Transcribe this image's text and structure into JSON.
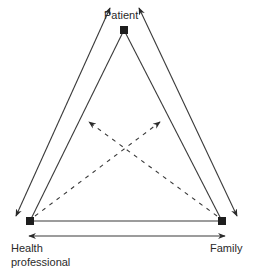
{
  "diagram": {
    "type": "triangle-relationship",
    "nodes": [
      {
        "id": "patient",
        "label": "Patient"
      },
      {
        "id": "health_professional",
        "label_line1": "Health",
        "label_line2": "professional"
      },
      {
        "id": "family",
        "label": "Family"
      }
    ],
    "edges": [
      {
        "from": "patient",
        "to": "health_professional",
        "style": "solid",
        "kind": "connection"
      },
      {
        "from": "patient",
        "to": "health_professional",
        "style": "solid",
        "kind": "bidirectional-arrow"
      },
      {
        "from": "patient",
        "to": "family",
        "style": "solid",
        "kind": "connection"
      },
      {
        "from": "patient",
        "to": "family",
        "style": "solid",
        "kind": "bidirectional-arrow"
      },
      {
        "from": "health_professional",
        "to": "family",
        "style": "solid",
        "kind": "connection"
      },
      {
        "from": "health_professional",
        "to": "family",
        "style": "solid",
        "kind": "bidirectional-arrow"
      },
      {
        "from": "health_professional",
        "to": "triangle-interior",
        "style": "dashed",
        "kind": "arrow"
      },
      {
        "from": "family",
        "to": "triangle-interior",
        "style": "dashed",
        "kind": "arrow"
      }
    ],
    "colors": {
      "line": "#3a3a3a",
      "node": "#1e1e1e",
      "text": "#2a2a2a",
      "background": "#ffffff"
    }
  }
}
